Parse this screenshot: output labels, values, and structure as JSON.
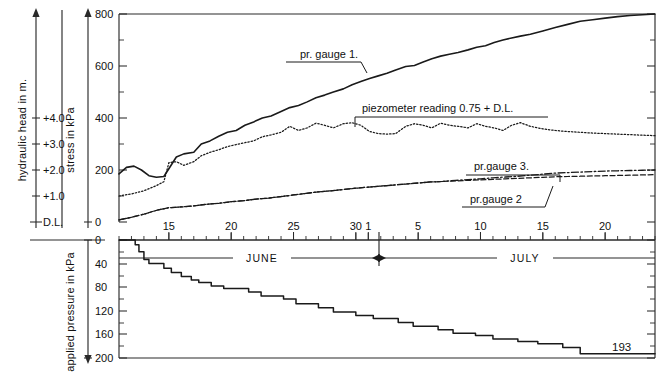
{
  "figure": {
    "title_visible": false
  },
  "axes": {
    "hydraulic_head": {
      "label": "hydraulic head in m.",
      "unit": "m",
      "ticks": [
        "+4.0",
        "+3.0",
        "+2.0",
        "+1.0",
        "D.L."
      ],
      "tick_values": [
        4.0,
        3.0,
        2.0,
        1.0,
        0.0
      ],
      "datum_label": "D.L."
    },
    "stress": {
      "label": "stress in kPa",
      "unit": "kPa",
      "ticks": [
        "800",
        "600",
        "400",
        "200",
        "0"
      ],
      "tick_values": [
        800,
        600,
        400,
        200,
        0
      ],
      "range": [
        0,
        800
      ],
      "minor_step": 100
    },
    "applied_pressure": {
      "label": "applied pressure in kPa",
      "unit": "kPa",
      "ticks": [
        "0",
        "40",
        "80",
        "120",
        "160",
        "200"
      ],
      "tick_values": [
        0,
        40,
        80,
        120,
        160,
        200
      ],
      "range": [
        0,
        200
      ],
      "direction": "downward"
    },
    "time": {
      "label": "",
      "months": [
        "JUNE",
        "JULY"
      ],
      "june_ticks": [
        "15",
        "20",
        "25",
        "30"
      ],
      "july_ticks": [
        "1",
        "5",
        "10",
        "15",
        "20"
      ],
      "minor_step_days": 1
    }
  },
  "annotations": {
    "pr_gauge_1": "pr. gauge 1.",
    "piezometer": "piezometer reading    0.75 + D.L.",
    "pr_gauge_3": "pr.gauge 3.",
    "pr_gauge_2": "pr.gauge 2",
    "final_pressure": "193"
  },
  "chart_data": {
    "type": "line",
    "xlabel": "JUNE - JULY",
    "ylabel": "stress in kPa",
    "ylim": [
      0,
      800
    ],
    "grid": false,
    "legend": "inline-annotations",
    "x_note": "x expressed in day-of-record, June 11 = 11 ... June 30 = 30, July 1 = 31 ... July 24 = 54",
    "series": [
      {
        "name": "pr. gauge 1.",
        "style": "solid",
        "unit": "kPa",
        "x": [
          11,
          11.6,
          12.2,
          12.8,
          13.4,
          14,
          14.6,
          15,
          15.6,
          16.2,
          17,
          17.6,
          18.3,
          19,
          19.7,
          20.4,
          21.1,
          21.8,
          22.5,
          23.2,
          24,
          24.7,
          25.4,
          26.1,
          26.8,
          27.5,
          28.2,
          29,
          29.7,
          30.4,
          31.1,
          31.8,
          32.5,
          33.2,
          34,
          34.7,
          35.4,
          36.1,
          36.8,
          37.5,
          38.2,
          39,
          39.7,
          40.4,
          41.1,
          41.8,
          42.5,
          43.2,
          44,
          45,
          46,
          47,
          48,
          49,
          50,
          51,
          52,
          53,
          54
        ],
        "y": [
          185,
          210,
          215,
          200,
          178,
          172,
          175,
          205,
          250,
          262,
          268,
          300,
          312,
          330,
          345,
          352,
          372,
          385,
          400,
          408,
          425,
          440,
          448,
          462,
          478,
          488,
          500,
          512,
          528,
          540,
          552,
          562,
          572,
          585,
          598,
          602,
          615,
          628,
          638,
          645,
          652,
          662,
          672,
          678,
          690,
          700,
          708,
          715,
          722,
          735,
          748,
          760,
          772,
          778,
          784,
          790,
          794,
          797,
          800
        ]
      },
      {
        "name": "piezometer reading 0.75 + D.L.",
        "style": "dotted",
        "unit": "kPa",
        "x": [
          11,
          12,
          13,
          14,
          14.6,
          15,
          15.6,
          16.2,
          17,
          17.6,
          18.3,
          19,
          19.7,
          20.4,
          21.1,
          21.8,
          22.5,
          23.2,
          24,
          24.7,
          25.4,
          26.1,
          26.8,
          27.5,
          28.2,
          29,
          29.7,
          30.4,
          31.1,
          31.8,
          32.5,
          33.2,
          34,
          34.7,
          35.4,
          36.1,
          36.8,
          37.5,
          38.2,
          39,
          39.7,
          40.4,
          41.1,
          41.8,
          42.5,
          43.2,
          44,
          45,
          46,
          47,
          48,
          49,
          50,
          51,
          52,
          53,
          54
        ],
        "y": [
          100,
          108,
          120,
          140,
          155,
          228,
          232,
          218,
          232,
          255,
          268,
          278,
          290,
          298,
          305,
          312,
          328,
          335,
          345,
          368,
          352,
          362,
          380,
          372,
          362,
          378,
          382,
          372,
          348,
          340,
          338,
          340,
          368,
          378,
          372,
          362,
          380,
          372,
          368,
          362,
          378,
          368,
          362,
          352,
          372,
          382,
          368,
          358,
          352,
          348,
          345,
          342,
          340,
          338,
          336,
          334,
          332
        ]
      },
      {
        "name": "pr.gauge 2",
        "style": "dashed",
        "unit": "kPa",
        "x": [
          11,
          12,
          13,
          14,
          15,
          16,
          17,
          18,
          19,
          20,
          21,
          22,
          23,
          24,
          25,
          26,
          27,
          28,
          29,
          30,
          31,
          32,
          33,
          34,
          35,
          36,
          37,
          38,
          39,
          40,
          41,
          42,
          43,
          44,
          45,
          46,
          47,
          48,
          49,
          50,
          51,
          52,
          53,
          54
        ],
        "y": [
          8,
          18,
          30,
          45,
          55,
          58,
          62,
          68,
          72,
          78,
          82,
          88,
          92,
          98,
          104,
          110,
          116,
          120,
          125,
          130,
          134,
          138,
          142,
          146,
          150,
          154,
          156,
          158,
          160,
          162,
          164,
          166,
          168,
          170,
          172,
          174,
          175,
          176,
          177,
          178,
          179,
          180,
          181,
          182
        ]
      },
      {
        "name": "pr.gauge 3.",
        "style": "dash-dot",
        "unit": "kPa",
        "x": [
          11,
          12,
          13,
          14,
          15,
          16,
          17,
          18,
          19,
          20,
          21,
          22,
          23,
          24,
          25,
          26,
          27,
          28,
          29,
          30,
          31,
          32,
          33,
          34,
          35,
          36,
          37,
          38,
          39,
          40,
          41,
          42,
          43,
          44,
          45,
          46,
          47,
          48,
          49,
          50,
          51,
          52,
          53,
          54
        ],
        "y": [
          8,
          18,
          30,
          45,
          55,
          58,
          62,
          68,
          72,
          78,
          82,
          88,
          92,
          98,
          104,
          110,
          116,
          120,
          125,
          130,
          134,
          138,
          142,
          146,
          150,
          154,
          156,
          160,
          163,
          166,
          170,
          173,
          176,
          180,
          184,
          188,
          190,
          192,
          194,
          196,
          197,
          198,
          199,
          200
        ]
      },
      {
        "name": "applied pressure",
        "style": "step-solid",
        "unit": "kPa",
        "panel": "lower",
        "x": [
          11,
          12,
          12.3,
          12.6,
          13,
          13.4,
          14.6,
          15.2,
          16,
          16.8,
          17.4,
          18.4,
          19.4,
          21.4,
          22.4,
          24.2,
          25.2,
          27,
          28.2,
          30,
          31.4,
          33.4,
          34.6,
          36.6,
          37.8,
          39.6,
          41,
          43,
          44.6,
          46.6,
          48,
          54
        ],
        "y": [
          0,
          0,
          8,
          20,
          33,
          40,
          48,
          55,
          62,
          68,
          72,
          78,
          82,
          88,
          95,
          100,
          108,
          115,
          122,
          128,
          133,
          140,
          146,
          152,
          158,
          162,
          168,
          172,
          176,
          182,
          193,
          193
        ]
      }
    ],
    "final_applied_pressure": 193
  }
}
